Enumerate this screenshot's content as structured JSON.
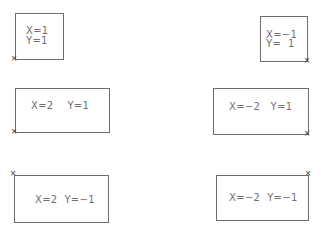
{
  "diagram": {
    "boxes": [
      {
        "id": "b1",
        "line1": "X=1",
        "line2": "Y=1",
        "anchor": "bottom-left"
      },
      {
        "id": "b2",
        "line1": "X=−1",
        "line2": "Y=  1",
        "anchor": "bottom-right"
      },
      {
        "id": "b3",
        "text": "X=2    Y=1",
        "anchor": "bottom-left"
      },
      {
        "id": "b4",
        "text": "X=−2   Y=1",
        "anchor": "bottom-right"
      },
      {
        "id": "b5",
        "text": "X=2  Y=−1",
        "anchor": "top-left"
      },
      {
        "id": "b6",
        "text": "X=−2  Y=−1",
        "anchor": "top-right"
      }
    ],
    "marker_glyph": "×",
    "line_color": "#6e6e6e",
    "text_color": "#707070"
  }
}
